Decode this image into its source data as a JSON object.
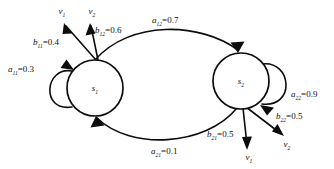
{
  "diagram": {
    "type": "hmm-state-transition",
    "title": "",
    "background_color": "#ffffff",
    "stroke_color": "#0d0d0d",
    "states": [
      {
        "id": "s1",
        "symbol": "s",
        "subscript": "1",
        "cx": 95,
        "cy": 88,
        "r": 28
      },
      {
        "id": "s2",
        "symbol": "s",
        "subscript": "2",
        "cx": 241,
        "cy": 81,
        "r": 28
      }
    ],
    "transitions": [
      {
        "id": "a11",
        "symbol": "a",
        "subscript": "11",
        "value": "0.3",
        "from": "s1",
        "to": "s1",
        "kind": "self-loop",
        "label_x": 8,
        "label_y": 72
      },
      {
        "id": "a12",
        "symbol": "a",
        "subscript": "12",
        "value": "0.7",
        "from": "s1",
        "to": "s2",
        "kind": "curve",
        "label_x": 152,
        "label_y": 23
      },
      {
        "id": "a21",
        "symbol": "a",
        "subscript": "21",
        "value": "0.1",
        "from": "s2",
        "to": "s1",
        "kind": "curve",
        "label_x": 151,
        "label_y": 154
      },
      {
        "id": "a22",
        "symbol": "a",
        "subscript": "22",
        "value": "0.9",
        "from": "s2",
        "to": "s2",
        "kind": "self-loop",
        "label_x": 291,
        "label_y": 97
      }
    ],
    "emissions": [
      {
        "id": "b11",
        "symbol": "b",
        "subscript": "11",
        "value": "0.4",
        "from": "s1",
        "output": "v1",
        "label_x": 33,
        "label_y": 45
      },
      {
        "id": "b12",
        "symbol": "b",
        "subscript": "12",
        "value": "0.6",
        "from": "s1",
        "output": "v2",
        "label_x": 95,
        "label_y": 33
      },
      {
        "id": "b21",
        "symbol": "b",
        "subscript": "21",
        "value": "0.5",
        "from": "s2",
        "output": "v1",
        "label_x": 207,
        "label_y": 137
      },
      {
        "id": "b22",
        "symbol": "b",
        "subscript": "22",
        "value": "0.5",
        "from": "s2",
        "output": "v2",
        "label_x": 276,
        "label_y": 119
      }
    ],
    "outputs": [
      {
        "id": "v1-top",
        "symbol": "v",
        "subscript": "1",
        "x": 62,
        "y": 14
      },
      {
        "id": "v2-top",
        "symbol": "v",
        "subscript": "2",
        "x": 92,
        "y": 14
      },
      {
        "id": "v1-bottom",
        "symbol": "v",
        "subscript": "1",
        "x": 249,
        "y": 160
      },
      {
        "id": "v2-bottom",
        "symbol": "v",
        "subscript": "2",
        "x": 287,
        "y": 147
      }
    ],
    "equals_sign": "="
  }
}
